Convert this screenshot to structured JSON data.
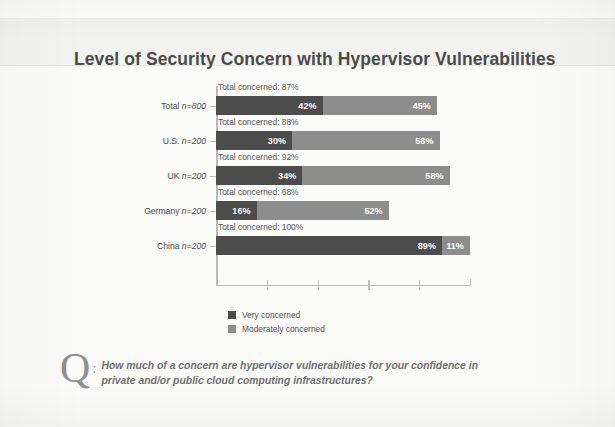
{
  "title": "Level of Security Concern with Hypervisor Vulnerabilities",
  "colors": {
    "very_concerned": "#4c4c4c",
    "moderately_concerned": "#8d8d8d",
    "title_text": "#4b4b4b",
    "page_background": "#fbfbfa",
    "title_band": "#f2f2f0"
  },
  "legend": {
    "items": [
      {
        "label": "Very concerned",
        "color": "#4c4c4c"
      },
      {
        "label": "Moderately concerned",
        "color": "#8d8d8d"
      }
    ]
  },
  "question": {
    "glyph": "Q",
    "colon": ":",
    "line1": "How much of a concern are hypervisor vulnerabilities for your confidence in",
    "line2": "private and/or public cloud computing infrastructures?"
  },
  "chart_data": {
    "type": "bar",
    "orientation": "horizontal",
    "stacked": true,
    "title": "Level of Security Concern with Hypervisor Vulnerabilities",
    "xlabel": "",
    "ylabel": "",
    "xlim": [
      0,
      110
    ],
    "grid": false,
    "legend_position": "bottom-left",
    "categories": [
      "Total n=800",
      "U.S. n=200",
      "UK n=200",
      "Germany n=200",
      "China n=200"
    ],
    "category_parts": [
      {
        "name": "Total",
        "n": "n=800"
      },
      {
        "name": "U.S.",
        "n": "n=200"
      },
      {
        "name": "UK",
        "n": "n=200"
      },
      {
        "name": "Germany",
        "n": "n=200"
      },
      {
        "name": "China",
        "n": "n=200"
      }
    ],
    "series": [
      {
        "name": "Very concerned",
        "values": [
          42,
          30,
          34,
          16,
          89
        ]
      },
      {
        "name": "Moderately concerned",
        "values": [
          45,
          58,
          58,
          52,
          11
        ]
      }
    ],
    "annotations": [
      "Total concerned: 87%",
      "Total concerned: 88%",
      "Total concerned: 92%",
      "Total concerned: 68%",
      "Total concerned: 100%"
    ],
    "rows": [
      {
        "category": "Total",
        "n": "n=800",
        "total_label": "Total concerned: 87%",
        "very": 42,
        "very_label": "42%",
        "moderate": 45,
        "moderate_label": "45%",
        "total": 87
      },
      {
        "category": "U.S.",
        "n": "n=200",
        "total_label": "Total concerned: 88%",
        "very": 30,
        "very_label": "30%",
        "moderate": 58,
        "moderate_label": "58%",
        "total": 88
      },
      {
        "category": "UK",
        "n": "n=200",
        "total_label": "Total concerned: 92%",
        "very": 34,
        "very_label": "34%",
        "moderate": 58,
        "moderate_label": "58%",
        "total": 92
      },
      {
        "category": "Germany",
        "n": "n=200",
        "total_label": "Total concerned: 68%",
        "very": 16,
        "very_label": "16%",
        "moderate": 52,
        "moderate_label": "52%",
        "total": 68
      },
      {
        "category": "China",
        "n": "n=200",
        "total_label": "Total concerned: 100%",
        "very": 89,
        "very_label": "89%",
        "moderate": 11,
        "moderate_label": "11%",
        "total": 100
      }
    ]
  }
}
